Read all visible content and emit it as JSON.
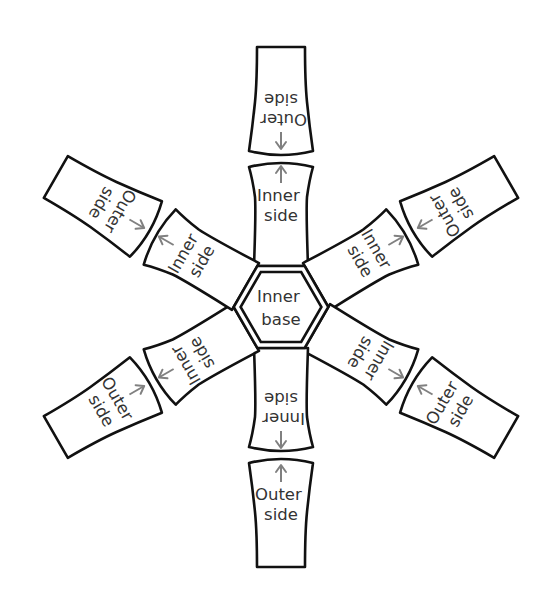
{
  "diagram": {
    "center_label": {
      "line1": "Inner",
      "line2": "base"
    },
    "arms": [
      {
        "angle": 0,
        "inner": {
          "line1": "Inner",
          "line2": "side"
        },
        "outer": {
          "line1": "Outer",
          "line2": "side"
        }
      },
      {
        "angle": 60,
        "inner": {
          "line1": "Inner",
          "line2": "side"
        },
        "outer": {
          "line1": "Outer",
          "line2": "side"
        }
      },
      {
        "angle": 120,
        "inner": {
          "line1": "Inner",
          "line2": "side"
        },
        "outer": {
          "line1": "Outer",
          "line2": "side"
        }
      },
      {
        "angle": 180,
        "inner": {
          "line1": "Inner",
          "line2": "side"
        },
        "outer": {
          "line1": "Outer",
          "line2": "side"
        }
      },
      {
        "angle": 240,
        "inner": {
          "line1": "Inner",
          "line2": "side"
        },
        "outer": {
          "line1": "Outer",
          "line2": "side"
        }
      },
      {
        "angle": 300,
        "inner": {
          "line1": "Inner",
          "line2": "side"
        },
        "outer": {
          "line1": "Outer",
          "line2": "side"
        }
      }
    ],
    "colors": {
      "outline": "#111111",
      "text": "#333333",
      "arrow": "#808080",
      "background": "#ffffff"
    }
  }
}
